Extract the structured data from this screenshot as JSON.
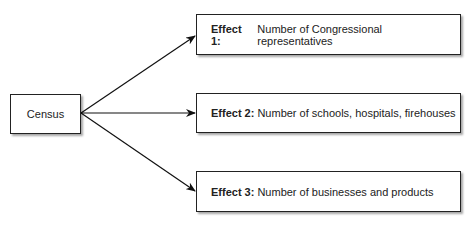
{
  "diagram": {
    "source": {
      "label": "Census"
    },
    "effects": [
      {
        "title": "Effect 1:",
        "text": "Number of Congressional representatives"
      },
      {
        "title": "Effect 2:",
        "text": "Number of schools, hospitals, firehouses"
      },
      {
        "title": "Effect 3:",
        "text": "Number of businesses and products"
      }
    ],
    "edges": [
      {
        "from": "Census",
        "to": "Effect 1"
      },
      {
        "from": "Census",
        "to": "Effect 2"
      },
      {
        "from": "Census",
        "to": "Effect 3"
      }
    ]
  }
}
